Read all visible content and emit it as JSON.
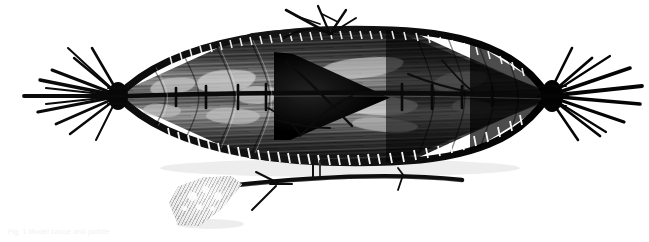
{
  "scene": {
    "background_color": "#ffffff",
    "medium": "black-and-white photograph",
    "subject": "model skin-covered canoe (kayak) seen from above with paddle",
    "width": 649,
    "height": 242
  },
  "canoe": {
    "name": "model canoe",
    "orientation": "horizontal, bow left / stern right",
    "hull_color": "#3a3a3a",
    "gunwale_color": "#101010",
    "interior_highlight_color": "#d8d8d8",
    "cockpit_color": "#080808",
    "bow_label": "bow with splayed twig bundle",
    "stern_label": "stern with splayed twig bundle",
    "cockpit_label": "dark triangular cockpit opening",
    "midship_twigs_label": "upright twig lashing at midship",
    "stand_label": "thin vertical display mount"
  },
  "paddle": {
    "name": "paddle",
    "blade_label": "woven fan-shaped paddle blade",
    "blade_color": "#d7d7d7",
    "shaft_label": "curved dark wooden shaft",
    "shaft_color": "#111111",
    "crossbar_label": "twig crossbar lashing",
    "branch_stub_label": "small branch stub on shaft"
  },
  "caption": {
    "text": "Fig. 1 Model canoe and paddle",
    "color": "#f2f2f2"
  },
  "interior_patches": [
    {
      "name": "patch-fore-upper",
      "x": 150,
      "y": 78,
      "w": 46,
      "h": 16,
      "rot": -7,
      "color": "#c8c8c8"
    },
    {
      "name": "patch-fore-lower",
      "x": 143,
      "y": 104,
      "w": 38,
      "h": 13,
      "rot": 4,
      "color": "#bdbdbd"
    },
    {
      "name": "patch-mid-upper",
      "x": 196,
      "y": 70,
      "w": 60,
      "h": 22,
      "rot": -5,
      "color": "#d2d2d2"
    },
    {
      "name": "patch-mid-lower",
      "x": 206,
      "y": 108,
      "w": 54,
      "h": 16,
      "rot": 3,
      "color": "#c0c0c0"
    },
    {
      "name": "patch-centre",
      "x": 236,
      "y": 86,
      "w": 44,
      "h": 18,
      "rot": -2,
      "color": "#cccccc"
    },
    {
      "name": "patch-aft-upper",
      "x": 318,
      "y": 58,
      "w": 86,
      "h": 20,
      "rot": -6,
      "color": "#c6c6c6"
    },
    {
      "name": "patch-aft-mid",
      "x": 340,
      "y": 96,
      "w": 78,
      "h": 19,
      "rot": 2,
      "color": "#d4d4d4"
    },
    {
      "name": "patch-aft-lower",
      "x": 352,
      "y": 118,
      "w": 66,
      "h": 14,
      "rot": 5,
      "color": "#b6b6b6"
    },
    {
      "name": "patch-stern",
      "x": 432,
      "y": 72,
      "w": 56,
      "h": 18,
      "rot": -8,
      "color": "#bfbfbf"
    },
    {
      "name": "patch-stern-2",
      "x": 452,
      "y": 100,
      "w": 42,
      "h": 14,
      "rot": 6,
      "color": "#b0b0b0"
    }
  ],
  "blade_spots": [
    {
      "name": "blade-spot-1",
      "x": 22,
      "y": 16,
      "d": 9
    },
    {
      "name": "blade-spot-2",
      "x": 36,
      "y": 10,
      "d": 7
    },
    {
      "name": "blade-spot-3",
      "x": 48,
      "y": 16,
      "d": 8
    },
    {
      "name": "blade-spot-4",
      "x": 30,
      "y": 28,
      "d": 6
    },
    {
      "name": "blade-spot-5",
      "x": 44,
      "y": 30,
      "d": 5
    },
    {
      "name": "blade-spot-6",
      "x": 16,
      "y": 30,
      "d": 5
    }
  ]
}
